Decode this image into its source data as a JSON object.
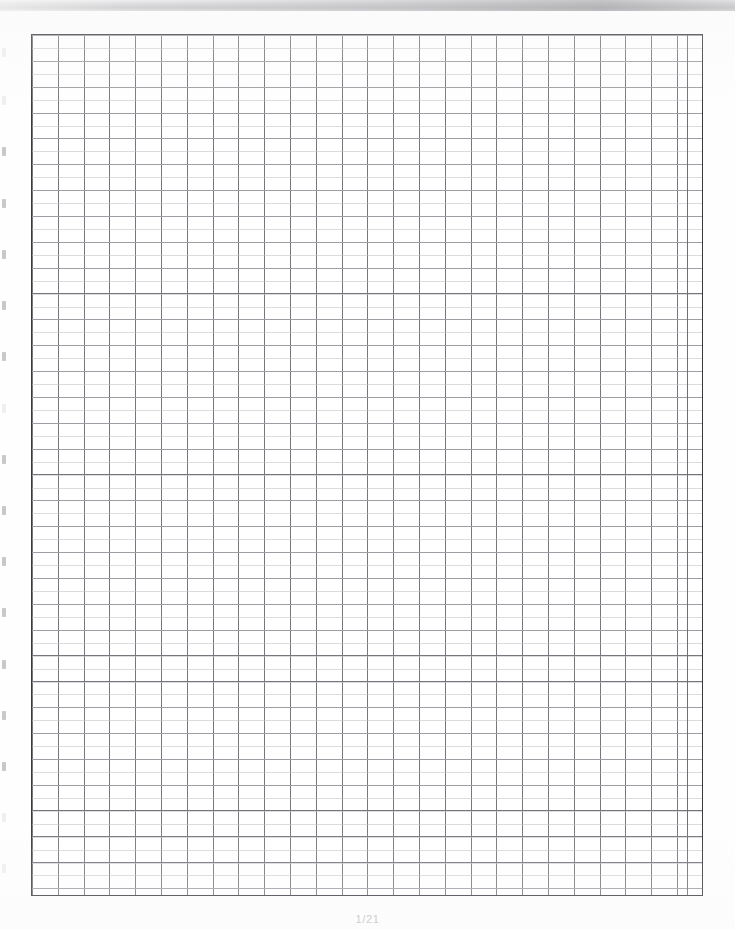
{
  "document": {
    "kind": "scanned-graph-paper",
    "caption": "1/21"
  },
  "scan": {
    "top_band_label": "scanner-edge-band",
    "background_color": "#ffffff",
    "band_color": "#bdbdc0"
  },
  "grid": {
    "border_color": "#3a3a3e",
    "line_color": "#76767c",
    "soft_line_color": "#bec0c4",
    "cell_size_px": 26,
    "columns": 26,
    "rows": 33,
    "left_px": 31,
    "top_px": 34,
    "width_px": 672,
    "height_px": 862
  },
  "edge_marks": [
    {
      "top": 48,
      "faint": true
    },
    {
      "top": 96,
      "faint": true
    },
    {
      "top": 147,
      "faint": false
    },
    {
      "top": 199,
      "faint": false
    },
    {
      "top": 250,
      "faint": false
    },
    {
      "top": 301,
      "faint": false
    },
    {
      "top": 352,
      "faint": false
    },
    {
      "top": 404,
      "faint": true
    },
    {
      "top": 455,
      "faint": false
    },
    {
      "top": 506,
      "faint": false
    },
    {
      "top": 557,
      "faint": false
    },
    {
      "top": 608,
      "faint": false
    },
    {
      "top": 660,
      "faint": false
    },
    {
      "top": 711,
      "faint": false
    },
    {
      "top": 762,
      "faint": false
    },
    {
      "top": 813,
      "faint": true
    },
    {
      "top": 864,
      "faint": true
    }
  ]
}
